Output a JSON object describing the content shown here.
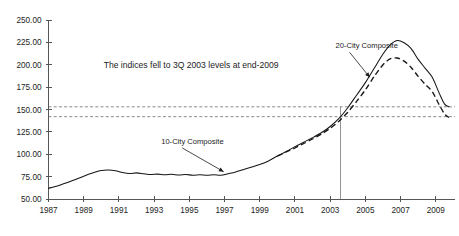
{
  "chart_data": {
    "type": "line",
    "title": "",
    "xlabel": "",
    "ylabel": "",
    "xlim": [
      1987,
      2009.75
    ],
    "ylim": [
      50,
      250
    ],
    "grid": false,
    "legend_position": "inline-annotations",
    "y_ticks": [
      "250.00",
      "225.00",
      "200.00",
      "175.00",
      "150.00",
      "125.00",
      "100.00",
      "75.00",
      "50.00"
    ],
    "y_tick_values": [
      250,
      225,
      200,
      175,
      150,
      125,
      100,
      75,
      50
    ],
    "x_ticks": [
      "1987",
      "1989",
      "1991",
      "1993",
      "1995",
      "1997",
      "1999",
      "2001",
      "2003",
      "2005",
      "2007",
      "2009"
    ],
    "x_tick_values": [
      1987,
      1989,
      1991,
      1993,
      1995,
      1997,
      1999,
      2001,
      2003,
      2005,
      2007,
      2009
    ],
    "annotations": [
      {
        "name": "indices-note",
        "text": "The indices fell to 3Q 2003 levels at end-2009",
        "x": 1995.1,
        "y": 196
      }
    ],
    "reference_lines": {
      "horizontal": [
        {
          "name": "ten-city-end-level",
          "value": 153.0
        },
        {
          "name": "twenty-city-end-level",
          "value": 142.0
        }
      ],
      "vertical": [
        {
          "name": "third-quarter-2003",
          "value": 2003.6,
          "from": 50,
          "to": 153.0
        }
      ]
    },
    "series": [
      {
        "name": "10-City Composite",
        "style": "solid",
        "label_x": 1993.4,
        "label_y": 112,
        "arrow_from_x": 1994.6,
        "arrow_from_y": 107,
        "arrow_to_x": 1996.95,
        "arrow_to_y": 80.5,
        "x": [
          1987.0,
          1987.5,
          1988.0,
          1988.5,
          1989.0,
          1989.5,
          1990.0,
          1990.4,
          1990.8,
          1991.2,
          1991.6,
          1992.0,
          1992.4,
          1992.8,
          1993.2,
          1993.6,
          1994.0,
          1994.4,
          1994.8,
          1995.2,
          1995.6,
          1996.0,
          1996.4,
          1996.8,
          1997.2,
          1997.6,
          1998.0,
          1998.5,
          1999.0,
          1999.5,
          2000.0,
          2000.5,
          2001.0,
          2001.5,
          2002.0,
          2002.5,
          2003.0,
          2003.5,
          2004.0,
          2004.5,
          2005.0,
          2005.5,
          2006.0,
          2006.4,
          2006.8,
          2007.2,
          2007.6,
          2008.0,
          2008.4,
          2008.8,
          2009.2,
          2009.5,
          2009.75
        ],
        "y": [
          62.0,
          64.5,
          68.0,
          71.5,
          75.5,
          79.0,
          81.8,
          82.3,
          81.6,
          79.6,
          78.4,
          79.2,
          78.2,
          77.3,
          77.8,
          77.0,
          77.6,
          76.8,
          77.3,
          76.6,
          77.0,
          76.5,
          77.0,
          76.6,
          78.3,
          80.0,
          82.5,
          85.5,
          88.5,
          92.5,
          98.0,
          103.0,
          108.5,
          113.5,
          118.5,
          124.0,
          131.0,
          140.0,
          152.0,
          166.0,
          180.0,
          196.0,
          212.0,
          222.0,
          227.0,
          224.5,
          218.0,
          206.0,
          196.0,
          186.0,
          168.0,
          156.0,
          153.0
        ]
      },
      {
        "name": "20-City Composite",
        "style": "dashed",
        "label_x": 2003.3,
        "label_y": 219,
        "arrow_from_x": 2004.1,
        "arrow_from_y": 214,
        "arrow_to_x": 2005.25,
        "arrow_to_y": 186,
        "x": [
          2000.0,
          2000.5,
          2001.0,
          2001.5,
          2002.0,
          2002.5,
          2003.0,
          2003.5,
          2004.0,
          2004.5,
          2005.0,
          2005.5,
          2006.0,
          2006.4,
          2006.8,
          2007.2,
          2007.6,
          2008.0,
          2008.4,
          2008.8,
          2009.2,
          2009.5,
          2009.75
        ],
        "y": [
          98.0,
          102.5,
          107.0,
          112.0,
          117.0,
          122.5,
          129.0,
          137.0,
          147.0,
          159.0,
          172.0,
          187.0,
          200.0,
          206.5,
          207.5,
          204.0,
          197.0,
          187.0,
          178.0,
          170.0,
          155.0,
          145.0,
          141.0
        ]
      }
    ]
  }
}
